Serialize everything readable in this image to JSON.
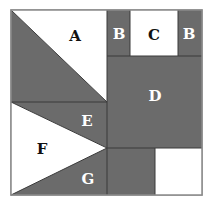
{
  "colors": {
    "dark": "#6b6b6b",
    "light": "#ffffff",
    "stroke": "#3a3a3a",
    "label_dark_bg": "#ffffff",
    "label_light_bg": "#111111"
  },
  "pieces": {
    "A": {
      "label": "A"
    },
    "B_left": {
      "label": "B"
    },
    "C": {
      "label": "C"
    },
    "B_right": {
      "label": "B"
    },
    "D": {
      "label": "D"
    },
    "E": {
      "label": "E"
    },
    "F": {
      "label": "F"
    },
    "G": {
      "label": "G"
    }
  }
}
